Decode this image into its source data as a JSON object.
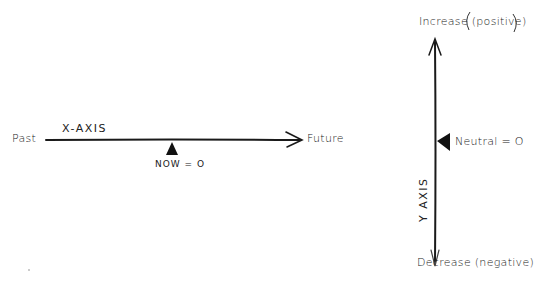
{
  "x_axis": {
    "title": "X-AXIS",
    "left_label": "Past",
    "right_label": "Future",
    "marker_label": "NOW = O"
  },
  "y_axis": {
    "title": "Y AXIS",
    "top_label": "Increase (positive)",
    "bottom_label": "Decrease (negative)",
    "marker_label": "Neutral = O"
  },
  "colors": {
    "ink": "#1a1a1a",
    "paper": "#ffffff"
  }
}
